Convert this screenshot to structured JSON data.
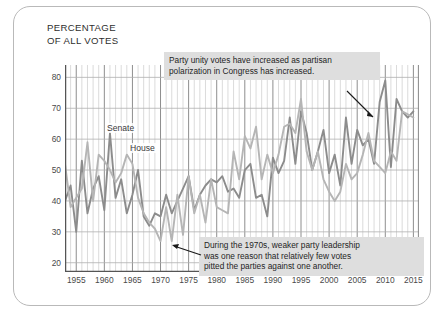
{
  "chart_data": {
    "type": "line",
    "title": "PERCENTAGE\nOF ALL VOTES",
    "xlabel": "",
    "ylabel": "PERCENTAGE OF ALL VOTES",
    "xlim": [
      1953,
      2016
    ],
    "ylim": [
      17,
      84
    ],
    "grid": true,
    "legend_position": "inline-direct-labels",
    "xticks": [
      1955,
      1960,
      1965,
      1970,
      1975,
      1980,
      1985,
      1990,
      1995,
      2000,
      2005,
      2010,
      2015
    ],
    "yticks": [
      20,
      30,
      40,
      50,
      60,
      70,
      80
    ],
    "x": [
      1953,
      1954,
      1955,
      1956,
      1957,
      1958,
      1959,
      1960,
      1961,
      1962,
      1963,
      1964,
      1965,
      1966,
      1967,
      1968,
      1969,
      1970,
      1971,
      1972,
      1973,
      1974,
      1975,
      1976,
      1977,
      1978,
      1979,
      1980,
      1981,
      1982,
      1983,
      1984,
      1985,
      1986,
      1987,
      1988,
      1989,
      1990,
      1991,
      1992,
      1993,
      1994,
      1995,
      1996,
      1997,
      1998,
      1999,
      2000,
      2001,
      2002,
      2003,
      2004,
      2005,
      2006,
      2007,
      2008,
      2009,
      2010,
      2011,
      2012,
      2013,
      2014,
      2015
    ],
    "series": [
      {
        "name": "Senate",
        "color": "#8c8c8c",
        "values": [
          40,
          45,
          30,
          53,
          36,
          44,
          48,
          37,
          62,
          41,
          47,
          36,
          42,
          50,
          35,
          32,
          36,
          35,
          42,
          36,
          40,
          44,
          48,
          37,
          42,
          45,
          47,
          46,
          48,
          43,
          44,
          41,
          50,
          52,
          41,
          42,
          35,
          54,
          49,
          53,
          67,
          52,
          69,
          62,
          50,
          56,
          63,
          49,
          55,
          45,
          67,
          52,
          63,
          58,
          60,
          52,
          72,
          79,
          51,
          73,
          69,
          67,
          69
        ]
      },
      {
        "name": "House",
        "color": "#b5b5b5",
        "values": [
          52,
          38,
          41,
          44,
          59,
          40,
          55,
          53,
          50,
          46,
          49,
          55,
          52,
          41,
          36,
          33,
          31,
          27,
          38,
          27,
          42,
          29,
          48,
          36,
          42,
          33,
          47,
          38,
          37,
          36,
          56,
          47,
          61,
          57,
          64,
          47,
          55,
          49,
          55,
          64,
          65,
          62,
          73,
          56,
          50,
          56,
          47,
          43,
          40,
          43,
          52,
          47,
          49,
          55,
          62,
          53,
          51,
          49,
          56,
          53,
          69,
          68,
          67
        ]
      }
    ],
    "annotations": [
      {
        "id": "annotation-1",
        "text": "Party unity votes have increased as partisan\npolarization in Congress has increased.",
        "points_to_year": 2002
      },
      {
        "id": "annotation-2",
        "text": "During the 1970s, weaker party leadership\nwas one reason that relatively few votes\npitted the parties against one another.",
        "points_to_year": 1970
      }
    ],
    "series_labels": [
      {
        "id": "label-senate",
        "text": "Senate"
      },
      {
        "id": "label-house",
        "text": "House"
      }
    ]
  }
}
